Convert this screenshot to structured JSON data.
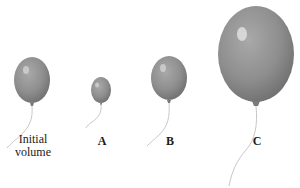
{
  "figure": {
    "balloon_color": "#8f8f8f",
    "balloon_highlight": "#e4e4e4",
    "string_color": "#c8c8c8",
    "balloons": [
      {
        "id": "initial",
        "label_line1": "Initial",
        "label_line2": "volume",
        "relative_size": "medium"
      },
      {
        "id": "A",
        "label": "A",
        "relative_size": "small"
      },
      {
        "id": "B",
        "label": "B",
        "relative_size": "medium"
      },
      {
        "id": "C",
        "label": "C",
        "relative_size": "large"
      }
    ]
  }
}
